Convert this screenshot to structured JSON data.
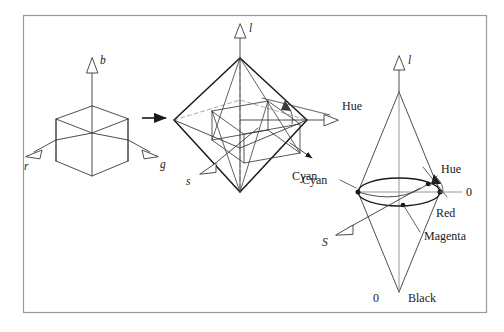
{
  "figure": {
    "name": "rgb-cube-to-hls-double-cone-diagram",
    "background_color": "#ffffff",
    "stroke_color": "#333333",
    "frame": {
      "x": 23,
      "y": 15,
      "width": 464,
      "height": 298,
      "color": "#9a9a9a"
    }
  },
  "panels": {
    "cube": {
      "name": "rgb-cube",
      "axes": [
        {
          "id": "b",
          "label": "b",
          "direction": "up"
        },
        {
          "id": "r",
          "label": "r",
          "direction": "down-left"
        },
        {
          "id": "g",
          "label": "g",
          "direction": "down-right"
        }
      ]
    },
    "octahedron": {
      "name": "hls-octahedron",
      "axes": [
        {
          "id": "l",
          "label": "l",
          "direction": "up"
        },
        {
          "id": "s",
          "label": "s",
          "direction": "down-left"
        },
        {
          "id": "hue",
          "label": "Hue",
          "direction": "right"
        }
      ],
      "annotations": [
        {
          "id": "cyan",
          "label": "Cyan"
        }
      ]
    },
    "doublecone": {
      "name": "hls-double-cone",
      "axes": [
        {
          "id": "l",
          "label": "l",
          "direction": "up"
        },
        {
          "id": "S",
          "label": "S",
          "direction": "down-left"
        }
      ],
      "annotations": [
        {
          "id": "hue",
          "label": "Hue"
        },
        {
          "id": "zero-right",
          "label": "0"
        },
        {
          "id": "cyan",
          "label": "Cyan"
        },
        {
          "id": "red",
          "label": "Red"
        },
        {
          "id": "magenta",
          "label": "Magenta"
        },
        {
          "id": "zero-bottom",
          "label": "0"
        },
        {
          "id": "black",
          "label": "Black"
        }
      ]
    }
  },
  "transition": {
    "name": "transform-arrow",
    "label": ""
  }
}
